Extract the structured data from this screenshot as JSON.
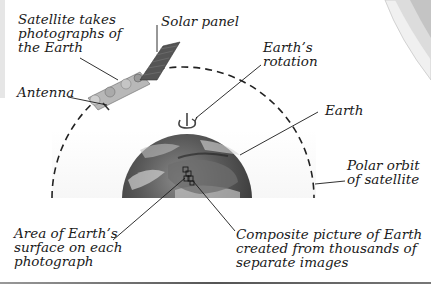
{
  "diagram": {
    "labels": {
      "satellite": [
        "Satellite takes",
        "photographs of",
        "the Earth"
      ],
      "solar_panel": [
        "Solar panel"
      ],
      "antenna": [
        "Antenna"
      ],
      "rotation": [
        "Earth’s",
        "rotation"
      ],
      "earth": [
        "Earth"
      ],
      "polar_orbit": [
        "Polar orbit",
        "of satellite"
      ],
      "area": [
        "Area of Earth’s",
        "surface on each",
        "photograph"
      ],
      "composite": [
        "Composite picture of Earth",
        "created  from thousands of",
        "separate images"
      ]
    },
    "colors": {
      "background": "#ffffff",
      "text": "#1a1a1a",
      "orbit_dash": "#222222",
      "earth_dark": "#3a3a3a",
      "earth_light": "#9a9a9a",
      "corner_shade": "#d0d0d0"
    }
  }
}
